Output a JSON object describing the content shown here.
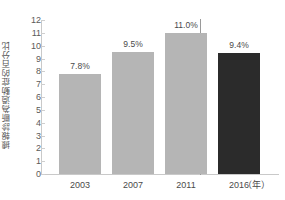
{
  "chart_data": {
    "type": "bar",
    "title": "",
    "subtitle": "",
    "categories": [
      "2003",
      "2007",
      "2011",
      "2016"
    ],
    "values": [
      7.8,
      9.5,
      11.0,
      9.4
    ],
    "data_labels": [
      "7.8%",
      "9.5%",
      "11.0%",
      "9.4%"
    ],
    "series": [
      {
        "name": "",
        "values": [
          7.8,
          9.5,
          11.0,
          9.4
        ],
        "colors": [
          "#b5b5b5",
          "#b5b5b5",
          "#b5b5b5",
          "#2b2b2b"
        ]
      }
    ],
    "xlabel": "",
    "x_axis_unit": "（年）",
    "ylabel": "據報診斷為過動症的百分比",
    "ylim": [
      0,
      12
    ],
    "y_ticks": [
      "0",
      "1",
      "2",
      "3",
      "4",
      "5",
      "6",
      "7",
      "8",
      "9",
      "10",
      "11",
      "12"
    ],
    "grid": false,
    "legend": "none",
    "annotations": [
      {
        "name": "group-divider",
        "description": "vertical separator between 2011 and 2016 bars",
        "color": "#9a9a9a"
      }
    ],
    "colors": {
      "bar_light": "#b5b5b5",
      "bar_dark": "#2b2b2b",
      "axis": "#c9c9c9",
      "text": "#4a4a4a",
      "background": "#ffffff"
    }
  }
}
